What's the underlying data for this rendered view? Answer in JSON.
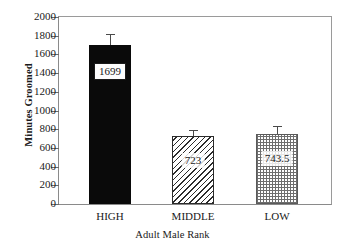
{
  "chart_data": {
    "type": "bar",
    "title": "",
    "xlabel": "Adult Male Rank",
    "ylabel": "Minutes Groomed",
    "categories": [
      "HIGH",
      "MIDDLE",
      "LOW"
    ],
    "values": [
      1699,
      723,
      743.5
    ],
    "value_labels": [
      "1699",
      "723",
      "743.5"
    ],
    "errors_upper": [
      120,
      65,
      92
    ],
    "error_tops": [
      1819,
      788,
      835.5
    ],
    "ylim": [
      0,
      2000
    ],
    "yticks": [
      2000,
      1800,
      1600,
      1400,
      1200,
      1000,
      800,
      600,
      400,
      200,
      0
    ],
    "ytick_labels": [
      "2000",
      "1800",
      "1600",
      "1400",
      "1200",
      "1000",
      "800",
      "600",
      "400",
      "200",
      "0"
    ],
    "grid": false,
    "legend": null,
    "series": [
      {
        "name": "Minutes Groomed",
        "values": [
          1699,
          723,
          743.5
        ],
        "fills": [
          "solid-black",
          "diagonal-hatch",
          "dotted-grid"
        ]
      }
    ],
    "colors": {
      "bar_high": "#0a0a0a",
      "bar_middle_stroke": "#2b2b2b",
      "bar_low_stroke": "#5a5a5a",
      "axis": "#8a8a8a",
      "error_bar": "#4a4a4a",
      "text": "#1a1a1a",
      "background": "#ffffff"
    }
  }
}
